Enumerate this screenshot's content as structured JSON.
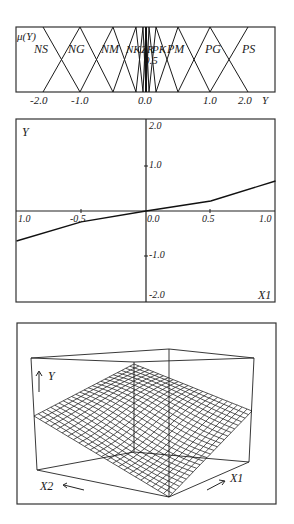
{
  "chart_data": [
    {
      "type": "line",
      "title": "Membership functions of output Y",
      "ylabel": "μ(Y)",
      "xlabel": "Y",
      "tick_labels": [
        "-2.0",
        "-1.0",
        "0.0",
        "1.0",
        "2.0"
      ],
      "inner_label": "0.5",
      "sets": [
        {
          "name": "NS",
          "left": -2.0,
          "peak": -2.0,
          "right": -1.0
        },
        {
          "name": "NG",
          "left": -2.0,
          "peak": -1.0,
          "right": -0.5
        },
        {
          "name": "NM",
          "left": -1.0,
          "peak": -0.5,
          "right": -0.15
        },
        {
          "name": "NK",
          "left": -0.5,
          "peak": -0.15,
          "right": -0.05
        },
        {
          "name": "NZ",
          "left": -0.15,
          "peak": -0.05,
          "right": 0.0
        },
        {
          "name": "ZR",
          "left": -0.05,
          "peak": 0.0,
          "right": 0.05
        },
        {
          "name": "PZ",
          "left": 0.0,
          "peak": 0.05,
          "right": 0.15
        },
        {
          "name": "PK",
          "left": 0.05,
          "peak": 0.15,
          "right": 0.5
        },
        {
          "name": "PM",
          "left": 0.15,
          "peak": 0.5,
          "right": 1.0
        },
        {
          "name": "PG",
          "left": 0.5,
          "peak": 1.0,
          "right": 2.0
        },
        {
          "name": "PS",
          "left": 1.0,
          "peak": 2.0,
          "right": 2.0
        }
      ],
      "visible_labels": [
        "NS",
        "NG",
        "NM",
        "NK",
        "ZR",
        "PK",
        "PM",
        "PG",
        "PS"
      ],
      "ylim": [
        0,
        1
      ]
    },
    {
      "type": "line",
      "title": "Control surface cross-section Y vs X1",
      "xlabel": "X1",
      "ylabel": "Y",
      "x": [
        -1.0,
        -0.5,
        0.0,
        0.5,
        1.0
      ],
      "values": [
        -0.66,
        -0.24,
        0.0,
        0.22,
        0.66
      ],
      "xlim": [
        -1.0,
        1.0
      ],
      "ylim": [
        -2.0,
        2.0
      ],
      "x_tick_labels": [
        "1.0",
        "-0.5",
        "0.0",
        "0.5",
        "1.0"
      ],
      "y_tick_labels": [
        "2.0",
        "1.0",
        "-1.0",
        "-2.0"
      ]
    },
    {
      "type": "surface",
      "title": "3D control surface Y(X1, X2)",
      "axis_labels": {
        "y": "Y",
        "x1": "X1",
        "x2": "X2"
      },
      "grid_resolution": 24,
      "description": "Saddle-shaped mesh surface: high at X1=-1,X2=+1 corner, low at X1=+1,X2=-1 corner, flat near zero along diagonal"
    }
  ],
  "labels": {
    "top": {
      "mu": "μ(Y)",
      "axis": "Y",
      "half": "0.5",
      "ticks": [
        "-2.0",
        "-1.0",
        "0.0",
        "1.0",
        "2.0"
      ],
      "sets": [
        "NS",
        "NG",
        "NM",
        "NK",
        "ZR",
        "PK",
        "PM",
        "PG",
        "PS"
      ]
    },
    "mid": {
      "ylabel": "Y",
      "xlabel": "X1",
      "y_ticks": [
        "2.0",
        "1.0",
        "-1.0",
        "-2.0"
      ],
      "x_ticks": [
        "1.0",
        "-0.5",
        "0.0",
        "0.5",
        "1.0"
      ]
    },
    "bottom": {
      "y": "Y",
      "x1": "X1",
      "x2": "X2"
    }
  }
}
